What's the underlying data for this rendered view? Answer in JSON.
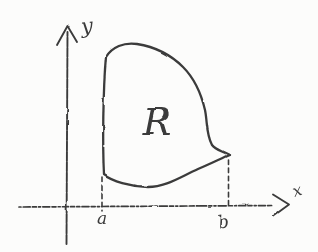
{
  "figure": {
    "labels": {
      "y_axis": "y",
      "x_axis": "x",
      "region": "R",
      "tick_a": "a",
      "tick_b": "b"
    },
    "colors": {
      "ink": "#3b3b3b",
      "paper": "#fcfcfb"
    }
  }
}
